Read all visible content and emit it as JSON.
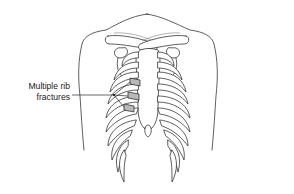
{
  "figure": {
    "annotation": {
      "line1": "Multiple rib",
      "line2": "fractures",
      "pointer_count": 3
    },
    "highlight_color": "#b8b8b8",
    "line_color": "#2a2a2a",
    "background": "#ffffff"
  }
}
